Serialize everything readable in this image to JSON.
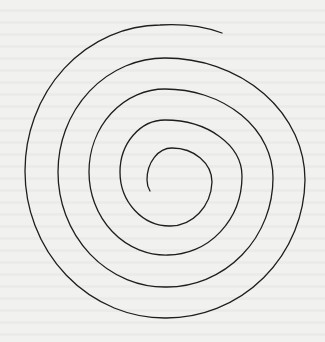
{
  "figure": {
    "title": "Spiral",
    "colors": {
      "background": "#f1f1ef",
      "stroke": "#1e1e1e"
    },
    "spiral": {
      "turns": 4.5,
      "approx_center": [
        166,
        174
      ],
      "outer_end": [
        222,
        33
      ],
      "inner_end": [
        150,
        191
      ],
      "stroke_width": 1.3
    }
  }
}
